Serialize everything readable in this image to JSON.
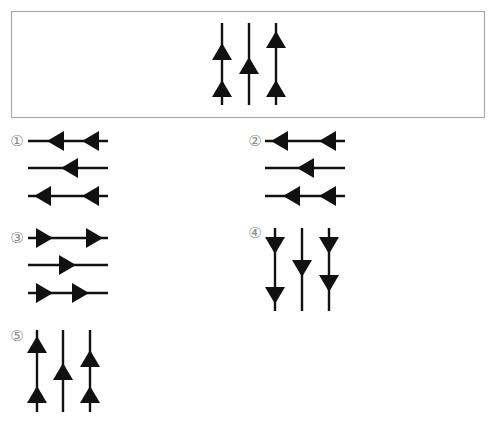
{
  "colors": {
    "ink": "#111111",
    "box_border": "#a8a8a8",
    "label": "#8a8a8a"
  },
  "question_box": {
    "x": 11,
    "y": 11,
    "w": 473,
    "h": 106,
    "orientation": "vertical",
    "lines": [
      {
        "pos": 222,
        "from": 23,
        "to": 105,
        "arrows": [
          {
            "tip": 43,
            "base": 60,
            "dir": "up"
          },
          {
            "tip": 80,
            "base": 97,
            "dir": "up"
          }
        ]
      },
      {
        "pos": 249,
        "from": 23,
        "to": 105,
        "arrows": [
          {
            "tip": 57,
            "base": 74,
            "dir": "up"
          }
        ]
      },
      {
        "pos": 276,
        "from": 23,
        "to": 105,
        "arrows": [
          {
            "tip": 31,
            "base": 48,
            "dir": "up"
          },
          {
            "tip": 80,
            "base": 97,
            "dir": "up"
          }
        ]
      }
    ]
  },
  "options": [
    {
      "label": "①",
      "label_x": 17,
      "label_y": 146,
      "orientation": "horizontal",
      "lines": [
        {
          "pos": 141,
          "from": 28,
          "to": 108,
          "arrows": [
            {
              "tip": 47,
              "base": 64,
              "dir": "left"
            },
            {
              "tip": 82,
              "base": 99,
              "dir": "left"
            }
          ]
        },
        {
          "pos": 168,
          "from": 28,
          "to": 108,
          "arrows": [
            {
              "tip": 61,
              "base": 78,
              "dir": "left"
            }
          ]
        },
        {
          "pos": 196,
          "from": 28,
          "to": 108,
          "arrows": [
            {
              "tip": 34,
              "base": 51,
              "dir": "left"
            },
            {
              "tip": 82,
              "base": 99,
              "dir": "left"
            }
          ]
        }
      ]
    },
    {
      "label": "②",
      "label_x": 255,
      "label_y": 146,
      "orientation": "horizontal",
      "lines": [
        {
          "pos": 141,
          "from": 265,
          "to": 345,
          "arrows": [
            {
              "tip": 271,
              "base": 288,
              "dir": "left"
            },
            {
              "tip": 319,
              "base": 336,
              "dir": "left"
            }
          ]
        },
        {
          "pos": 168,
          "from": 265,
          "to": 345,
          "arrows": [
            {
              "tip": 297,
              "base": 314,
              "dir": "left"
            }
          ]
        },
        {
          "pos": 196,
          "from": 265,
          "to": 345,
          "arrows": [
            {
              "tip": 283,
              "base": 300,
              "dir": "left"
            },
            {
              "tip": 319,
              "base": 336,
              "dir": "left"
            }
          ]
        }
      ]
    },
    {
      "label": "③",
      "label_x": 17,
      "label_y": 243,
      "orientation": "horizontal",
      "lines": [
        {
          "pos": 238,
          "from": 28,
          "to": 108,
          "arrows": [
            {
              "tip": 53,
              "base": 36,
              "dir": "right"
            },
            {
              "tip": 103,
              "base": 86,
              "dir": "right"
            }
          ]
        },
        {
          "pos": 265,
          "from": 28,
          "to": 108,
          "arrows": [
            {
              "tip": 76,
              "base": 59,
              "dir": "right"
            }
          ]
        },
        {
          "pos": 293,
          "from": 28,
          "to": 108,
          "arrows": [
            {
              "tip": 53,
              "base": 36,
              "dir": "right"
            },
            {
              "tip": 89,
              "base": 72,
              "dir": "right"
            }
          ]
        }
      ]
    },
    {
      "label": "④",
      "label_x": 255,
      "label_y": 238,
      "orientation": "vertical",
      "lines": [
        {
          "pos": 275,
          "from": 228,
          "to": 311,
          "arrows": [
            {
              "tip": 254,
              "base": 237,
              "dir": "down"
            },
            {
              "tip": 304,
              "base": 287,
              "dir": "down"
            }
          ]
        },
        {
          "pos": 302,
          "from": 228,
          "to": 311,
          "arrows": [
            {
              "tip": 277,
              "base": 260,
              "dir": "down"
            }
          ]
        },
        {
          "pos": 329,
          "from": 228,
          "to": 311,
          "arrows": [
            {
              "tip": 254,
              "base": 237,
              "dir": "down"
            },
            {
              "tip": 292,
              "base": 275,
              "dir": "down"
            }
          ]
        }
      ]
    },
    {
      "label": "⑤",
      "label_x": 17,
      "label_y": 341,
      "orientation": "vertical",
      "lines": [
        {
          "pos": 37,
          "from": 330,
          "to": 412,
          "arrows": [
            {
              "tip": 336,
              "base": 353,
              "dir": "up"
            },
            {
              "tip": 386,
              "base": 403,
              "dir": "up"
            }
          ]
        },
        {
          "pos": 63,
          "from": 330,
          "to": 412,
          "arrows": [
            {
              "tip": 363,
              "base": 380,
              "dir": "up"
            }
          ]
        },
        {
          "pos": 90,
          "from": 330,
          "to": 412,
          "arrows": [
            {
              "tip": 350,
              "base": 367,
              "dir": "up"
            },
            {
              "tip": 386,
              "base": 403,
              "dir": "up"
            }
          ]
        }
      ]
    }
  ],
  "arrow_half_width": 10,
  "line_width": 2.4
}
